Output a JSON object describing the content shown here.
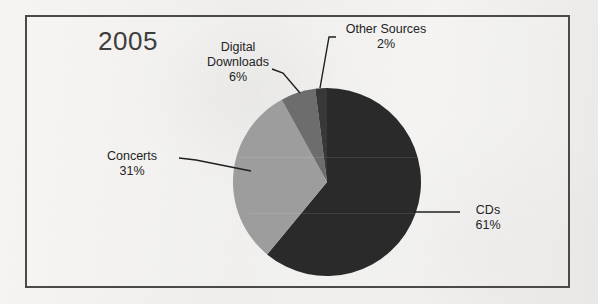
{
  "chart_data": {
    "type": "pie",
    "title": "2005",
    "xlabel": "",
    "ylabel": "",
    "legend_position": "none",
    "grid": false,
    "value_unit": "%",
    "categories": [
      "CDs",
      "Concerts",
      "Digital Downloads",
      "Other Sources"
    ],
    "values": [
      61,
      31,
      6,
      2
    ],
    "start_angle_deg": 0,
    "direction": "clockwise",
    "slices": [
      {
        "label": "CDs",
        "value": 61,
        "value_text": "61%",
        "color": "#2b2b2b",
        "start_deg": 0,
        "end_deg": 219.6,
        "label_name": "CDs",
        "label_pct": "61%"
      },
      {
        "label": "Concerts",
        "value": 31,
        "value_text": "31%",
        "color": "#9d9d9d",
        "start_deg": 219.6,
        "end_deg": 331.2,
        "label_name": "Concerts",
        "label_pct": "31%"
      },
      {
        "label": "Digital Downloads",
        "value": 6,
        "value_text": "6%",
        "color": "#6d6d6d",
        "start_deg": 331.2,
        "end_deg": 352.8,
        "label_name_line1": "Digital",
        "label_name_line2": "Downloads",
        "label_pct": "6%"
      },
      {
        "label": "Other Sources",
        "value": 2,
        "value_text": "2%",
        "color": "#383838",
        "start_deg": 352.8,
        "end_deg": 360,
        "label_name": "Other Sources",
        "label_pct": "2%"
      }
    ]
  },
  "frame": {
    "border_color": "#4a4a4a",
    "background_color": "#f2f0ee"
  },
  "title": {
    "text": "2005"
  },
  "labels": {
    "digital_downloads": {
      "line1": "Digital",
      "line2": "Downloads",
      "percent": "6%"
    },
    "other_sources": {
      "name": "Other Sources",
      "percent": "2%"
    },
    "concerts": {
      "name": "Concerts",
      "percent": "31%"
    },
    "cds": {
      "name": "CDs",
      "percent": "61%"
    }
  }
}
